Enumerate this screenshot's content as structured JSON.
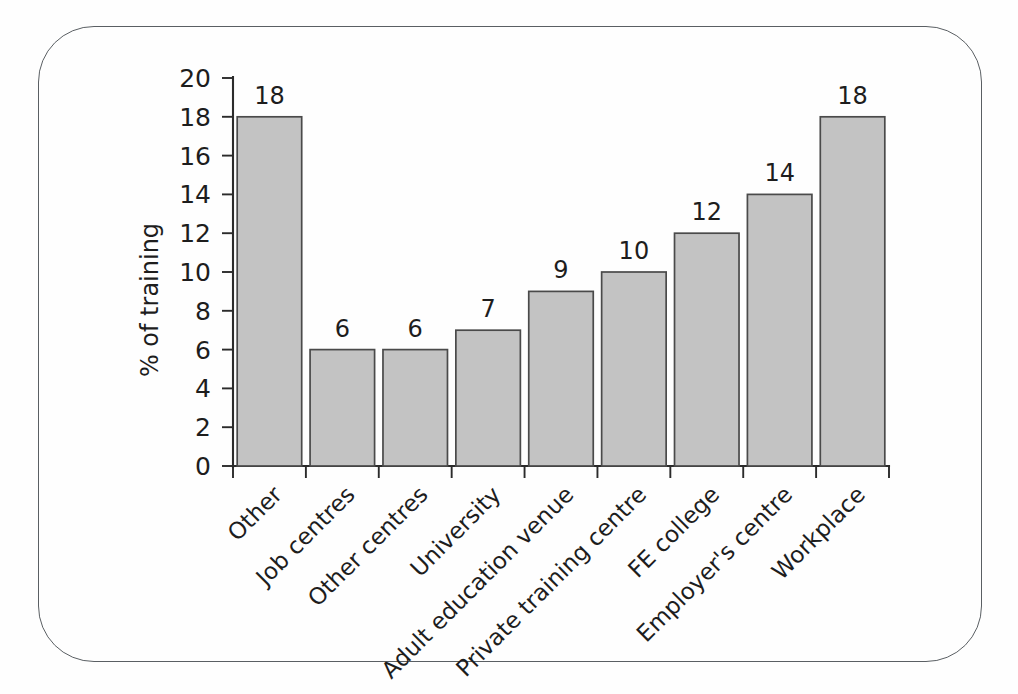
{
  "figure": {
    "frame_shape": "rounded-rectangle",
    "frame_color": "#5a5f63",
    "background_color": "#fefefe"
  },
  "chart_data": {
    "type": "bar",
    "title": "",
    "subtitle": "",
    "xlabel": "",
    "ylabel": "% of training",
    "categories": [
      "Other",
      "Job centres",
      "Other centres",
      "University",
      "Adult education venue",
      "Private training centre",
      "FE college",
      "Employer's centre",
      "Workplace"
    ],
    "values": [
      18,
      6,
      6,
      7,
      9,
      10,
      12,
      14,
      18
    ],
    "data_labels": [
      "18",
      "6",
      "6",
      "7",
      "9",
      "10",
      "12",
      "14",
      "18"
    ],
    "ylim": [
      0,
      20
    ],
    "ytick_values": [
      0,
      2,
      4,
      6,
      8,
      10,
      12,
      14,
      16,
      18,
      20
    ],
    "ytick_labels": [
      "0",
      "2",
      "4",
      "6",
      "8",
      "10",
      "12",
      "14",
      "16",
      "18",
      "20"
    ],
    "grid": false,
    "legend": false,
    "legend_position": "none",
    "bar_fill_color": "#c3c3c3",
    "bar_edge_color": "#4a4a4a",
    "axis_color": "#2b2b2b",
    "category_label_rotation": 45
  }
}
